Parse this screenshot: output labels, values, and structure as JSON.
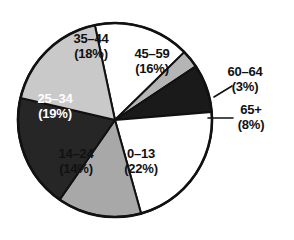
{
  "chart_data": {
    "type": "pie",
    "title": "",
    "subtitle": "",
    "xlabel": "",
    "ylabel": "",
    "grid": false,
    "legend_position": "none",
    "label_format": "range (percent%)",
    "total_percent": 100,
    "start_angle_deg": -12,
    "direction": "clockwise",
    "categories": [
      "45–59",
      "60–64",
      "65+",
      "0–13",
      "14–24",
      "25–34",
      "35–44"
    ],
    "values": [
      16,
      3,
      8,
      22,
      14,
      19,
      18
    ],
    "slices": [
      {
        "id": "slice-45-59",
        "label": "45–59",
        "range": "45–59",
        "percent": 16,
        "percent_text": "(16%)",
        "fill": "#ffffff",
        "stroke": "#111111",
        "text_color": "#111111",
        "label_placement": "inside",
        "label_x": 152,
        "label_y": 62
      },
      {
        "id": "slice-60-64",
        "label": "60–64",
        "range": "60–64",
        "percent": 3,
        "percent_text": "(3%)",
        "fill": "#b5b5b5",
        "stroke": "#111111",
        "text_color": "#111111",
        "label_placement": "outside",
        "label_x": 245,
        "label_y": 80
      },
      {
        "id": "slice-65-plus",
        "label": "65+",
        "range": "65+",
        "percent": 8,
        "percent_text": "(8%)",
        "fill": "#1a1a1a",
        "stroke": "#111111",
        "text_color": "#111111",
        "label_placement": "outside",
        "label_x": 251,
        "label_y": 118
      },
      {
        "id": "slice-0-13",
        "label": "0–13",
        "range": "0–13",
        "percent": 22,
        "percent_text": "(22%)",
        "fill": "#ffffff",
        "stroke": "#111111",
        "text_color": "#111111",
        "label_placement": "inside",
        "label_x": 141,
        "label_y": 162
      },
      {
        "id": "slice-14-24",
        "label": "14–24",
        "range": "14–24",
        "percent": 14,
        "percent_text": "(14%)",
        "fill": "#a8a8a8",
        "stroke": "#111111",
        "text_color": "#111111",
        "label_placement": "inside",
        "label_x": 76,
        "label_y": 162
      },
      {
        "id": "slice-25-34",
        "label": "25–34",
        "range": "25–34",
        "percent": 19,
        "percent_text": "(19%)",
        "fill": "#262626",
        "stroke": "#111111",
        "text_color": "#ffffff",
        "label_placement": "inside",
        "label_x": 55,
        "label_y": 107
      },
      {
        "id": "slice-35-44",
        "label": "35–44",
        "range": "35–44",
        "percent": 18,
        "percent_text": "(18%)",
        "fill": "#c9c9c9",
        "stroke": "#111111",
        "text_color": "#111111",
        "label_placement": "inside",
        "label_x": 91,
        "label_y": 47
      }
    ],
    "geometry": {
      "center_x": 115,
      "center_y": 120,
      "radius": 97
    },
    "colors": {
      "background": "#ffffff",
      "outline": "#111111",
      "white_slice": "#ffffff",
      "light_gray_slice": "#c9c9c9",
      "mid_gray_slice": "#a8a8a8",
      "dark_slice": "#262626",
      "black_slice": "#1a1a1a"
    }
  }
}
